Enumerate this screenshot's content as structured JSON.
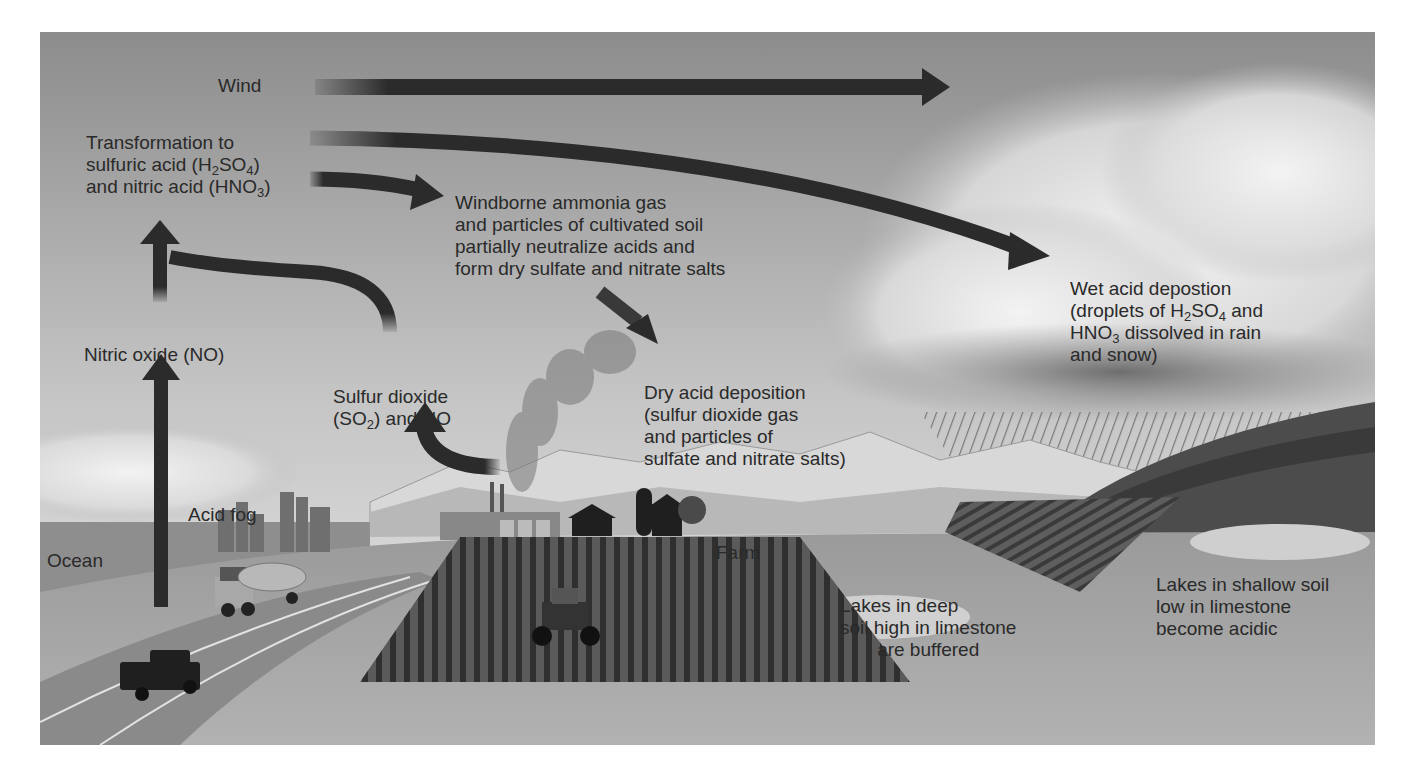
{
  "diagram": {
    "title": "Acid deposition",
    "labels": {
      "wind": "Wind",
      "transformation": {
        "line1": "Transformation to",
        "line2_pre": "sulfuric acid (H",
        "line2_sub1": "2",
        "line2_mid": "SO",
        "line2_sub2": "4",
        "line2_post": ")",
        "line3_pre": "and nitric acid (HNO",
        "line3_sub": "3",
        "line3_post": ")"
      },
      "windborne": {
        "line1": "Windborne ammonia gas",
        "line2": "and particles of cultivated soil",
        "line3": "partially neutralize acids and",
        "line4": "form dry sulfate and nitrate salts"
      },
      "wet_deposition": {
        "line1": "Wet acid depostion",
        "line2_pre": "(droplets of H",
        "line2_sub1": "2",
        "line2_mid": "SO",
        "line2_sub2": "4",
        "line2_post": " and",
        "line3_pre": "HNO",
        "line3_sub": "3",
        "line3_post": " dissolved in rain",
        "line4": "and snow)"
      },
      "nitric_oxide": "Nitric oxide (NO)",
      "sulfur_dioxide": {
        "line1": "Sulfur dioxide",
        "line2_pre": "(SO",
        "line2_sub": "2",
        "line2_post": ") and NO"
      },
      "dry_deposition": {
        "line1": "Dry acid deposition",
        "line2": "(sulfur dioxide gas",
        "line3": "and particles of",
        "line4": "sulfate and nitrate salts)"
      },
      "acid_fog": "Acid fog",
      "ocean": "Ocean",
      "farm": "Farm",
      "lakes_deep": {
        "line1": "Lakes in deep",
        "line2": "soil high in limestone",
        "line3": "are buffered"
      },
      "lakes_shallow": {
        "line1": "Lakes in shallow soil",
        "line2": "low in limestone",
        "line3": "become acidic"
      }
    },
    "arrows": [
      {
        "name": "wind-arrow",
        "from": "left",
        "to": "right"
      },
      {
        "name": "transformation-to-wet-arrow",
        "from": "transformation",
        "to": "wet acid deposition"
      },
      {
        "name": "transformation-to-windborne-arrow",
        "from": "transformation",
        "to": "windborne ammonia"
      },
      {
        "name": "windborne-to-dry-arrow",
        "from": "windborne ammonia",
        "to": "dry acid deposition"
      },
      {
        "name": "nitric-oxide-up-arrow",
        "from": "nitric oxide",
        "to": "transformation"
      },
      {
        "name": "vehicle-emission-arrow",
        "from": "vehicles",
        "to": "nitric oxide"
      },
      {
        "name": "sulfur-dioxide-to-transformation-arrow",
        "from": "sulfur dioxide",
        "to": "transformation"
      },
      {
        "name": "smokestack-to-sulfur-dioxide-arrow",
        "from": "power plant",
        "to": "sulfur dioxide"
      }
    ],
    "colors": {
      "sky_top": "#8a8a8a",
      "sky_bottom": "#e6e6e6",
      "arrow": "#2b2b2b",
      "ground": "#a5a5a5",
      "field": "#4a4a4a",
      "text": "#2a2a2a"
    }
  }
}
